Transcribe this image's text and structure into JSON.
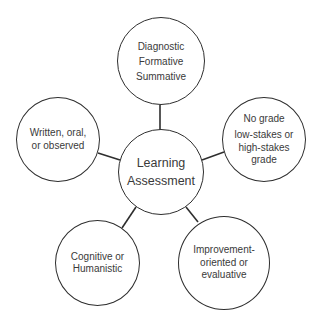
{
  "diagram": {
    "type": "hub-and-spoke",
    "center": {
      "lines": [
        "Learning",
        "Assessment"
      ]
    },
    "nodes": {
      "top": {
        "lines": [
          "Diagnostic",
          "Formative",
          "Summative"
        ]
      },
      "left": {
        "lines": [
          "Written, oral,",
          "or observed"
        ]
      },
      "right": {
        "lines": [
          "No grade",
          "low-stakes or",
          "high-stakes",
          "grade"
        ]
      },
      "bottom_left": {
        "lines": [
          "Cognitive or",
          "Humanistic"
        ]
      },
      "bottom_right": {
        "lines": [
          "Improvement-",
          "oriented or",
          "evaluative"
        ]
      }
    },
    "colors": {
      "stroke": "#2e2e2e",
      "text": "#3a3a3a",
      "background": "#ffffff"
    }
  }
}
